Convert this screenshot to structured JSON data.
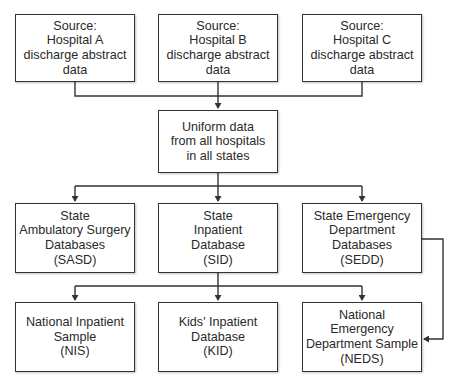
{
  "diagram": {
    "type": "flowchart",
    "nodes": {
      "hospital_a": {
        "label": "Source:\nHospital A\ndischarge abstract\ndata"
      },
      "hospital_b": {
        "label": "Source:\nHospital B\ndischarge abstract\ndata"
      },
      "hospital_c": {
        "label": "Source:\nHospital C\ndischarge abstract\ndata"
      },
      "uniform": {
        "label": "Uniform data\nfrom all hospitals\nin all states"
      },
      "sasd": {
        "label": "State\nAmbulatory Surgery\nDatabases\n(SASD)"
      },
      "sid": {
        "label": "State\nInpatient\nDatabase\n(SID)"
      },
      "sedd": {
        "label": "State Emergency\nDepartment\nDatabases\n(SEDD)"
      },
      "nis": {
        "label": "National Inpatient\nSample\n(NIS)"
      },
      "kid": {
        "label": "Kids' Inpatient\nDatabase\n(KID)"
      },
      "neds": {
        "label": "National\nEmergency\nDepartment Sample\n(NEDS)"
      }
    },
    "edges": [
      {
        "from": "hospital_a",
        "to": "uniform"
      },
      {
        "from": "hospital_b",
        "to": "uniform"
      },
      {
        "from": "hospital_c",
        "to": "uniform"
      },
      {
        "from": "uniform",
        "to": "sasd"
      },
      {
        "from": "uniform",
        "to": "sid"
      },
      {
        "from": "uniform",
        "to": "sedd"
      },
      {
        "from": "sid",
        "to": "nis"
      },
      {
        "from": "sid",
        "to": "kid"
      },
      {
        "from": "sid",
        "to": "neds"
      },
      {
        "from": "sedd",
        "to": "neds"
      }
    ],
    "colors": {
      "line": "#333333",
      "box_fill": "#ffffff",
      "text": "#2a2a2a"
    }
  }
}
